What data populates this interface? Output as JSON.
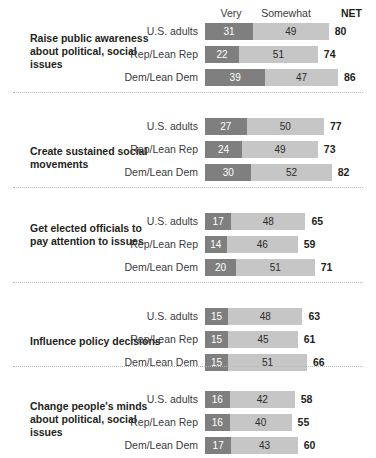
{
  "chart_data": {
    "type": "bar",
    "subtype": "stacked-horizontal",
    "title": "",
    "xlabel": "",
    "ylabel": "",
    "xlim": [
      0,
      100
    ],
    "grid": false,
    "legend_position": "top",
    "column_headers": {
      "very": "Very",
      "somewhat": "Somewhat",
      "net": "NET"
    },
    "series": [
      {
        "name": "Very",
        "color": "#7f7f7f"
      },
      {
        "name": "Somewhat",
        "color": "#c6c6c6"
      }
    ],
    "groups": [
      {
        "category": "Raise public awareness about political, social issues",
        "rows": [
          {
            "label": "U.S. adults",
            "very": 31,
            "somewhat": 49,
            "net": 80
          },
          {
            "label": "Rep/Lean Rep",
            "very": 22,
            "somewhat": 51,
            "net": 74
          },
          {
            "label": "Dem/Lean Dem",
            "very": 39,
            "somewhat": 47,
            "net": 86
          }
        ]
      },
      {
        "category": "Create sustained social movements",
        "rows": [
          {
            "label": "U.S. adults",
            "very": 27,
            "somewhat": 50,
            "net": 77
          },
          {
            "label": "Rep/Lean Rep",
            "very": 24,
            "somewhat": 49,
            "net": 73
          },
          {
            "label": "Dem/Lean Dem",
            "very": 30,
            "somewhat": 52,
            "net": 82
          }
        ]
      },
      {
        "category": "Get elected officials to pay attention to issues",
        "rows": [
          {
            "label": "U.S. adults",
            "very": 17,
            "somewhat": 48,
            "net": 65
          },
          {
            "label": "Rep/Lean Rep",
            "very": 14,
            "somewhat": 46,
            "net": 59
          },
          {
            "label": "Dem/Lean Dem",
            "very": 20,
            "somewhat": 51,
            "net": 71
          }
        ]
      },
      {
        "category": "Influence policy decisions",
        "rows": [
          {
            "label": "U.S. adults",
            "very": 15,
            "somewhat": 48,
            "net": 63
          },
          {
            "label": "Rep/Lean Rep",
            "very": 15,
            "somewhat": 45,
            "net": 61
          },
          {
            "label": "Dem/Lean Dem",
            "very": 15,
            "somewhat": 51,
            "net": 66
          }
        ]
      },
      {
        "category": "Change people's minds about political, social issues",
        "rows": [
          {
            "label": "U.S. adults",
            "very": 16,
            "somewhat": 42,
            "net": 58
          },
          {
            "label": "Rep/Lean Rep",
            "very": 16,
            "somewhat": 40,
            "net": 55
          },
          {
            "label": "Dem/Lean Dem",
            "very": 17,
            "somewhat": 43,
            "net": 60
          }
        ]
      }
    ]
  },
  "layout": {
    "bar_origin_x": 205,
    "px_per_unit": 1.546,
    "section_tops": [
      22,
      117,
      212,
      307,
      390
    ],
    "row_offsets": [
      0,
      23,
      46
    ],
    "divider_ys": [
      92,
      187,
      282,
      366,
      448
    ],
    "title_tops": [
      10,
      28,
      10,
      28,
      10
    ]
  }
}
